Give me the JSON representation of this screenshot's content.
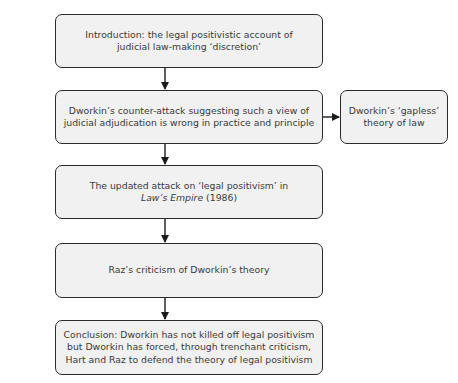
{
  "diagram": {
    "type": "flowchart",
    "nodes": [
      {
        "id": "intro",
        "lines": [
          "Introduction:  the legal positivistic account of",
          "judicial law-making ‘discretion’"
        ]
      },
      {
        "id": "counter_attack",
        "lines": [
          "Dworkin’s counter-attack suggesting such a view of",
          "judicial adjudication is wrong in practice and principle"
        ]
      },
      {
        "id": "gapless",
        "lines": [
          "Dworkin’s ‘gapless’",
          "theory of law"
        ]
      },
      {
        "id": "updated_attack",
        "line1": "The updated attack on ‘legal positivism’ in",
        "line2_italic": "Law’s Empire",
        "line2_rest": " (1986)"
      },
      {
        "id": "raz",
        "lines": [
          "Raz’s criticism of Dworkin’s theory"
        ]
      },
      {
        "id": "conclusion",
        "lines": [
          "Conclusion: Dworkin has not killed off legal positivism",
          "but Dworkin has forced, through trenchant criticism,",
          "Hart and Raz to defend the theory of legal positivism"
        ]
      }
    ],
    "edges": [
      {
        "from": "intro",
        "to": "counter_attack",
        "direction": "down"
      },
      {
        "from": "counter_attack",
        "to": "gapless",
        "direction": "right"
      },
      {
        "from": "counter_attack",
        "to": "updated_attack",
        "direction": "down"
      },
      {
        "from": "updated_attack",
        "to": "raz",
        "direction": "down"
      },
      {
        "from": "raz",
        "to": "conclusion",
        "direction": "down"
      }
    ],
    "colors": {
      "box_fill": "#f1f1f1",
      "box_border": "#2b2b2b",
      "text": "#3a3a3a",
      "arrow": "#1a1a1a"
    }
  }
}
